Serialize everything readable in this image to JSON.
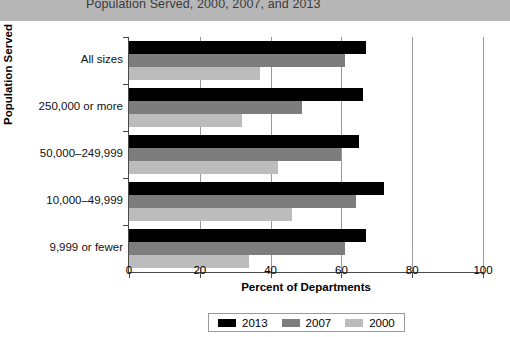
{
  "title": {
    "text": "Population Served, 2000, 2007, and 2013"
  },
  "chart_data": {
    "type": "bar",
    "orientation": "horizontal",
    "title": "Population Served, 2000, 2007, and 2013",
    "xlabel": "Percent of Departments",
    "ylabel": "Population Served",
    "xlim": [
      0,
      100
    ],
    "xticks": [
      0,
      20,
      40,
      60,
      80,
      100
    ],
    "grid": "vertical",
    "legend_position": "bottom-center",
    "categories": [
      "All sizes",
      "250,000 or more",
      "50,000–249,999",
      "10,000–49,999",
      "9,999 or fewer"
    ],
    "series": [
      {
        "name": "2013",
        "color": "#000000",
        "values": [
          67,
          66,
          65,
          72,
          67
        ]
      },
      {
        "name": "2007",
        "color": "#7d7d7d",
        "values": [
          61,
          49,
          60,
          64,
          61
        ]
      },
      {
        "name": "2000",
        "color": "#bcbcbc",
        "values": [
          37,
          32,
          42,
          46,
          34
        ]
      }
    ]
  },
  "axes": {
    "x_title": "Percent of Departments",
    "y_title": "Population Served",
    "x_tick_labels": [
      "0",
      "20",
      "40",
      "60",
      "80",
      "100"
    ]
  },
  "legend": {
    "items": [
      {
        "label": "2013",
        "color": "#000000"
      },
      {
        "label": "2007",
        "color": "#7d7d7d"
      },
      {
        "label": "2000",
        "color": "#bcbcbc"
      }
    ]
  }
}
